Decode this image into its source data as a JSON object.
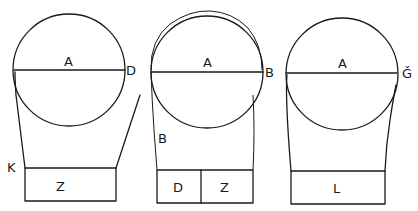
{
  "figures": [
    {
      "id": "left",
      "circle_label": "A",
      "diameter_right_label": "D",
      "side_label": "K",
      "boxes": [
        "Z"
      ]
    },
    {
      "id": "middle",
      "circle_label": "A",
      "diameter_right_label": "B",
      "side_label": "B",
      "boxes": [
        "D",
        "Z"
      ]
    },
    {
      "id": "right",
      "circle_label": "A",
      "diameter_right_label": "Ǧ",
      "boxes": [
        "L"
      ]
    }
  ],
  "colors": {
    "ink": "#1a1a1a",
    "background": "#ffffff"
  }
}
